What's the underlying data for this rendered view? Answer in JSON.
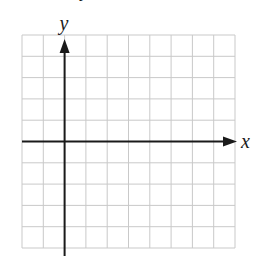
{
  "diagram": {
    "type": "coordinate-grid",
    "title_fragment": "y",
    "x_axis_label": "x",
    "y_axis_label": "y",
    "grid": {
      "columns": 10,
      "rows": 10,
      "left": 22,
      "top": 35,
      "cell": 21.3
    },
    "origin": {
      "col": 2,
      "row": 5
    },
    "colors": {
      "grid": "#c9c9c9",
      "axis": "#1a1a1a",
      "background": "#ffffff"
    }
  }
}
